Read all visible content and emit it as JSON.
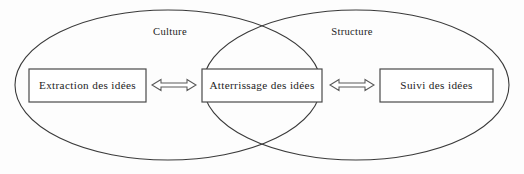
{
  "diagram": {
    "type": "venn-two-set",
    "background_color": "#fdfdfd",
    "stroke_color": "#3a3a3a",
    "text_color": "#1d1d1d",
    "box_fill": "#ffffff",
    "sets": [
      {
        "id": "culture",
        "label": "Culture",
        "label_x": 170,
        "label_y": 33,
        "cx": 168,
        "cy": 85,
        "rx": 153,
        "ry": 75
      },
      {
        "id": "structure",
        "label": "Structure",
        "label_x": 352,
        "label_y": 33,
        "cx": 356,
        "cy": 85,
        "rx": 153,
        "ry": 75
      }
    ],
    "boxes": [
      {
        "id": "extraction",
        "label": "Extraction des idées",
        "x": 29,
        "y": 69,
        "width": 117,
        "height": 33,
        "region": "culture-only"
      },
      {
        "id": "atterrissage",
        "label": "Atterrissage des idées",
        "x": 202,
        "y": 69,
        "width": 120,
        "height": 33,
        "region": "intersection"
      },
      {
        "id": "suivi",
        "label": "Suivi des idées",
        "x": 380,
        "y": 69,
        "width": 113,
        "height": 33,
        "region": "structure-only"
      }
    ],
    "arrows": [
      {
        "id": "extraction-atterrissage",
        "kind": "double-headed-open",
        "from": "extraction",
        "to": "atterrissage",
        "x1": 152,
        "x2": 196,
        "y": 85
      },
      {
        "id": "atterrissage-suivi",
        "kind": "double-headed-open",
        "from": "atterrissage",
        "to": "suivi",
        "x1": 330,
        "x2": 374,
        "y": 85
      }
    ],
    "intersections": [
      {
        "x": 262,
        "y": 26
      },
      {
        "x": 262,
        "y": 147
      }
    ]
  }
}
